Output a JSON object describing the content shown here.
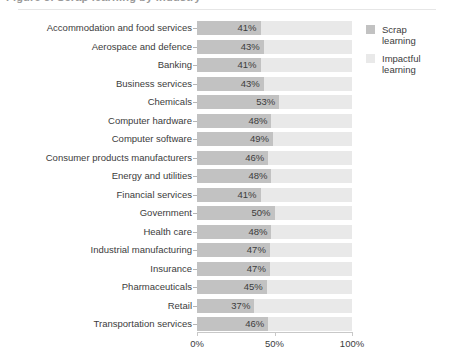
{
  "figure": {
    "title_clipped": "Figure 3. Scrap learning by industry",
    "axis_labels": [
      "0%",
      "50%",
      "100%"
    ],
    "axis_positions": [
      0,
      50,
      100
    ]
  },
  "legend": {
    "position": "right",
    "items": [
      {
        "label": "Scrap learning",
        "label_line1": "Scrap",
        "label_line2": "learning",
        "color": "#c2c2c2"
      },
      {
        "label": "Impactful learning",
        "label_line1": "Impactful",
        "label_line2": "learning",
        "color": "#e9e9e9"
      }
    ]
  },
  "chart_data": {
    "type": "bar",
    "orientation": "horizontal",
    "stacked": true,
    "title": "Figure 3. Scrap learning by industry",
    "xlabel": "",
    "ylabel": "",
    "xlim": [
      0,
      100
    ],
    "xticks": [
      0,
      50,
      100
    ],
    "xticklabels": [
      "0%",
      "50%",
      "100%"
    ],
    "grid": false,
    "legend_position": "right",
    "categories": [
      "Accommodation and food services",
      "Aerospace and defence",
      "Banking",
      "Business services",
      "Chemicals",
      "Computer hardware",
      "Computer software",
      "Consumer products manufacturers",
      "Energy and utilities",
      "Financial services",
      "Government",
      "Health care",
      "Industrial manufacturing",
      "Insurance",
      "Pharmaceuticals",
      "Retail",
      "Transportation services"
    ],
    "series": [
      {
        "name": "Scrap learning",
        "color": "#c2c2c2",
        "values": [
          41,
          43,
          41,
          43,
          53,
          48,
          49,
          46,
          48,
          41,
          50,
          48,
          47,
          47,
          45,
          37,
          46
        ],
        "labels": [
          "41%",
          "43%",
          "41%",
          "43%",
          "53%",
          "48%",
          "49%",
          "46%",
          "48%",
          "41%",
          "50%",
          "48%",
          "47%",
          "47%",
          "45%",
          "37%",
          "46%"
        ]
      },
      {
        "name": "Impactful learning",
        "color": "#e9e9e9",
        "values": [
          59,
          57,
          59,
          57,
          47,
          52,
          51,
          54,
          52,
          59,
          50,
          52,
          53,
          53,
          55,
          63,
          54
        ],
        "labels": []
      }
    ]
  }
}
